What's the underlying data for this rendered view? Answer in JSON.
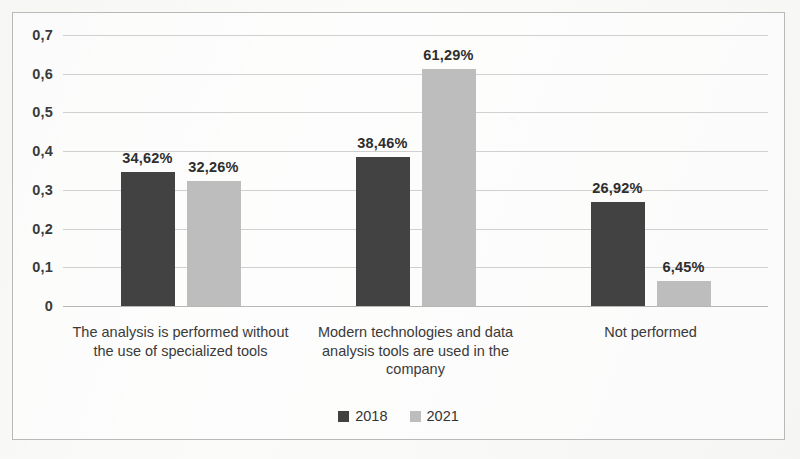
{
  "chart_data": {
    "type": "bar",
    "title": "",
    "subtitle": "",
    "xlabel": "",
    "ylabel": "",
    "ylim": [
      0,
      0.7
    ],
    "grid": true,
    "legend_position": "bottom",
    "y_ticks": [
      "0",
      "0,1",
      "0,2",
      "0,3",
      "0,4",
      "0,5",
      "0,6",
      "0,7"
    ],
    "y_tick_values": [
      0,
      0.1,
      0.2,
      0.3,
      0.4,
      0.5,
      0.6,
      0.7
    ],
    "categories": [
      "The analysis is performed without the use of specialized tools",
      "Modern technologies and data analysis tools are used in the company",
      "Not performed"
    ],
    "series": [
      {
        "name": "2018",
        "color": "#424242",
        "values": [
          0.3462,
          0.3846,
          0.2692
        ],
        "labels": [
          "34,62%",
          "38,46%",
          "26,92%"
        ]
      },
      {
        "name": "2021",
        "color": "#bdbdbd",
        "values": [
          0.3226,
          0.6129,
          0.0645
        ],
        "labels": [
          "32,26%",
          "61,29%",
          "6,45%"
        ]
      }
    ]
  },
  "legend": {
    "items": [
      {
        "label": "2018",
        "series": "series-2018"
      },
      {
        "label": "2021",
        "series": "series-2021"
      }
    ]
  },
  "scan_artifacts": {
    "ghost_lines": [
      "A",
      "B",
      "C"
    ]
  }
}
